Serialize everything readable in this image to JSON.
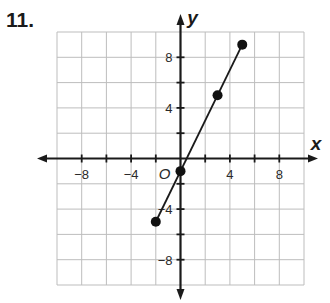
{
  "problem": {
    "number": "11."
  },
  "chart_data": {
    "type": "line",
    "title": "",
    "xlabel": "x",
    "ylabel": "y",
    "origin_label": "O",
    "xlim": [
      -10,
      10
    ],
    "ylim": [
      -10,
      10
    ],
    "grid": true,
    "grid_step": 2,
    "x_tick_labels": [
      {
        "value": -8,
        "label": "−8"
      },
      {
        "value": -4,
        "label": "−4"
      },
      {
        "value": 4,
        "label": "4"
      },
      {
        "value": 8,
        "label": "8"
      }
    ],
    "y_tick_labels": [
      {
        "value": 8,
        "label": "8"
      },
      {
        "value": 4,
        "label": "4"
      },
      {
        "value": -4,
        "label": "−4"
      },
      {
        "value": -8,
        "label": "−8"
      }
    ],
    "series": [
      {
        "name": "y = 2x - 1",
        "points": [
          {
            "x": -2,
            "y": -5
          },
          {
            "x": 0,
            "y": -1
          },
          {
            "x": 3,
            "y": 5
          },
          {
            "x": 5,
            "y": 9
          }
        ]
      }
    ],
    "colors": {
      "grid": "#bdbdbd",
      "axis": "#1a1a1a",
      "line": "#1a1a1a",
      "point": "#111111"
    }
  }
}
